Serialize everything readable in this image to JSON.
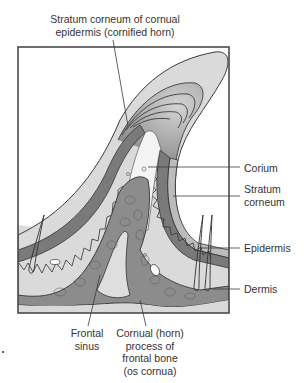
{
  "diagram": {
    "labels": {
      "top": [
        "Stratum corneum of cornual",
        "epidermis (cornified horn)"
      ],
      "corium": "Corium",
      "stratum_corneum": [
        "Stratum",
        "corneum"
      ],
      "epidermis": "Epidermis",
      "dermis": "Dermis",
      "frontal_sinus": [
        "Frontal",
        "sinus"
      ],
      "cornual_process": [
        "Cornual (horn)",
        "process of",
        "frontal bone",
        "(os cornua)"
      ]
    },
    "colors": {
      "frame": "#5a5a5a",
      "horn_outer": "#d9d9d9",
      "horn_rings": "#a8a8a8",
      "epidermis": "#7e7e7e",
      "corium": "#f2f2f2",
      "bone": "#8a8a8a",
      "dermis": "#dcdcdc",
      "stratum": "#b8b8b8"
    }
  }
}
